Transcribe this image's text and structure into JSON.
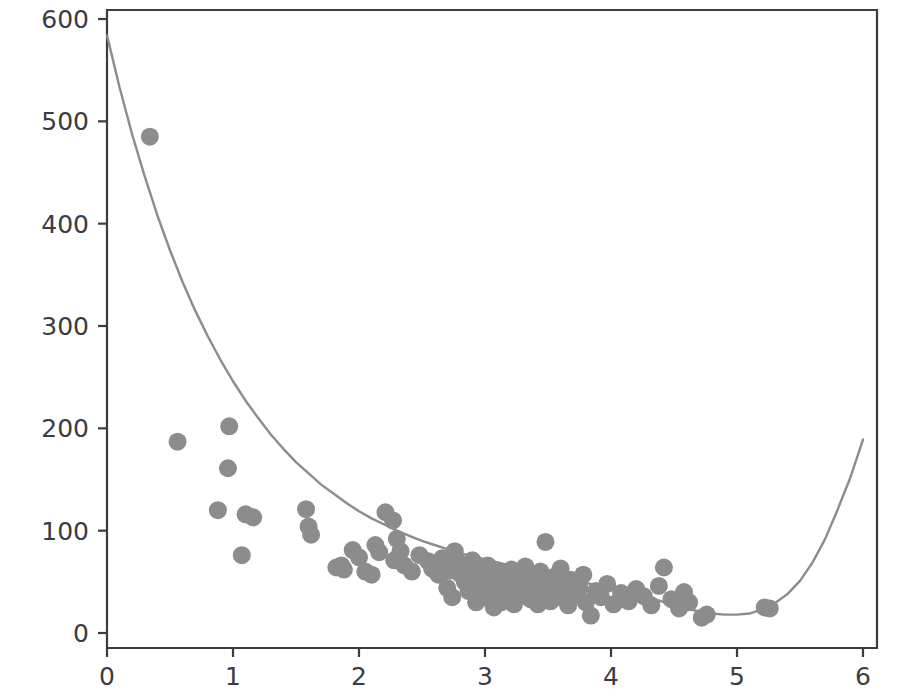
{
  "figure": {
    "background_color": "#ffffff",
    "axes_color": "#3b3b44",
    "point_color": "#8c8c8c",
    "curve_color": "#8c8c8c",
    "point_radius_px": 9,
    "plot_area_px": {
      "left": 107,
      "right": 877,
      "top": 10,
      "bottom": 648
    }
  },
  "chart_data": {
    "type": "scatter",
    "title": "",
    "subtitle": "",
    "xlabel": "",
    "ylabel": "",
    "xlim": [
      -0.25,
      6.1
    ],
    "ylim": [
      -15,
      620
    ],
    "grid": false,
    "legend": null,
    "xticks": [
      0,
      1,
      2,
      3,
      4,
      5,
      6
    ],
    "xtick_labels": [
      "0",
      "1",
      "2",
      "3",
      "4",
      "5",
      "6"
    ],
    "yticks": [
      0,
      100,
      200,
      300,
      400,
      500,
      600
    ],
    "ytick_labels": [
      "0",
      "100",
      "200",
      "300",
      "400",
      "500",
      "600"
    ],
    "series": [
      {
        "name": "observations",
        "kind": "scatter",
        "marker": "circle",
        "color": "#8c8c8c",
        "points": [
          [
            0.34,
            485
          ],
          [
            0.56,
            187
          ],
          [
            0.88,
            120
          ],
          [
            0.97,
            202
          ],
          [
            0.96,
            161
          ],
          [
            1.07,
            76
          ],
          [
            1.1,
            116
          ],
          [
            1.16,
            113
          ],
          [
            1.58,
            121
          ],
          [
            1.6,
            104
          ],
          [
            1.62,
            96
          ],
          [
            1.82,
            64
          ],
          [
            1.86,
            66
          ],
          [
            1.88,
            62
          ],
          [
            1.95,
            81
          ],
          [
            2.0,
            74
          ],
          [
            2.05,
            60
          ],
          [
            2.1,
            57
          ],
          [
            2.13,
            86
          ],
          [
            2.16,
            79
          ],
          [
            2.21,
            118
          ],
          [
            2.27,
            110
          ],
          [
            2.28,
            71
          ],
          [
            2.3,
            92
          ],
          [
            2.33,
            80
          ],
          [
            2.36,
            66
          ],
          [
            2.42,
            60
          ],
          [
            2.48,
            76
          ],
          [
            2.55,
            70
          ],
          [
            2.58,
            63
          ],
          [
            2.61,
            68
          ],
          [
            2.63,
            57
          ],
          [
            2.66,
            73
          ],
          [
            2.68,
            65
          ],
          [
            2.7,
            44
          ],
          [
            2.72,
            61
          ],
          [
            2.74,
            35
          ],
          [
            2.76,
            80
          ],
          [
            2.78,
            70
          ],
          [
            2.8,
            58
          ],
          [
            2.82,
            66
          ],
          [
            2.84,
            50
          ],
          [
            2.85,
            62
          ],
          [
            2.87,
            41
          ],
          [
            2.88,
            55
          ],
          [
            2.9,
            71
          ],
          [
            2.92,
            47
          ],
          [
            2.93,
            30
          ],
          [
            2.95,
            59
          ],
          [
            2.96,
            64
          ],
          [
            2.98,
            38
          ],
          [
            3.0,
            52
          ],
          [
            3.01,
            45
          ],
          [
            3.02,
            66
          ],
          [
            3.04,
            33
          ],
          [
            3.06,
            57
          ],
          [
            3.07,
            25
          ],
          [
            3.09,
            49
          ],
          [
            3.1,
            40
          ],
          [
            3.12,
            60
          ],
          [
            3.13,
            30
          ],
          [
            3.15,
            54
          ],
          [
            3.17,
            44
          ],
          [
            3.19,
            36
          ],
          [
            3.21,
            62
          ],
          [
            3.23,
            28
          ],
          [
            3.25,
            48
          ],
          [
            3.27,
            57
          ],
          [
            3.3,
            38
          ],
          [
            3.32,
            65
          ],
          [
            3.34,
            45
          ],
          [
            3.36,
            33
          ],
          [
            3.38,
            52
          ],
          [
            3.4,
            42
          ],
          [
            3.42,
            28
          ],
          [
            3.44,
            60
          ],
          [
            3.46,
            36
          ],
          [
            3.48,
            89
          ],
          [
            3.5,
            48
          ],
          [
            3.52,
            31
          ],
          [
            3.55,
            55
          ],
          [
            3.57,
            40
          ],
          [
            3.6,
            63
          ],
          [
            3.62,
            34
          ],
          [
            3.64,
            46
          ],
          [
            3.66,
            27
          ],
          [
            3.68,
            52
          ],
          [
            3.72,
            38
          ],
          [
            3.75,
            44
          ],
          [
            3.78,
            57
          ],
          [
            3.8,
            30
          ],
          [
            3.84,
            17
          ],
          [
            3.88,
            41
          ],
          [
            3.92,
            35
          ],
          [
            3.97,
            48
          ],
          [
            4.02,
            28
          ],
          [
            4.08,
            39
          ],
          [
            4.14,
            31
          ],
          [
            4.2,
            43
          ],
          [
            4.26,
            36
          ],
          [
            4.32,
            27
          ],
          [
            4.38,
            46
          ],
          [
            4.42,
            64
          ],
          [
            4.48,
            33
          ],
          [
            4.54,
            24
          ],
          [
            4.58,
            40
          ],
          [
            4.62,
            30
          ],
          [
            4.72,
            15
          ],
          [
            4.76,
            18
          ],
          [
            5.22,
            25
          ],
          [
            5.26,
            24
          ]
        ]
      },
      {
        "name": "fitted curve",
        "kind": "line",
        "color": "#8c8c8c",
        "points": [
          [
            0.0,
            584
          ],
          [
            0.1,
            533
          ],
          [
            0.2,
            487
          ],
          [
            0.3,
            446
          ],
          [
            0.4,
            408
          ],
          [
            0.5,
            374
          ],
          [
            0.6,
            343
          ],
          [
            0.7,
            315
          ],
          [
            0.8,
            290
          ],
          [
            0.9,
            267
          ],
          [
            1.0,
            246
          ],
          [
            1.1,
            227
          ],
          [
            1.2,
            210
          ],
          [
            1.3,
            194
          ],
          [
            1.4,
            180
          ],
          [
            1.5,
            167
          ],
          [
            1.6,
            156
          ],
          [
            1.7,
            145
          ],
          [
            1.8,
            136
          ],
          [
            1.9,
            127
          ],
          [
            2.0,
            119
          ],
          [
            2.1,
            112
          ],
          [
            2.2,
            106
          ],
          [
            2.3,
            100
          ],
          [
            2.4,
            95
          ],
          [
            2.5,
            90
          ],
          [
            2.6,
            86
          ],
          [
            2.7,
            82
          ],
          [
            2.8,
            78
          ],
          [
            2.9,
            75
          ],
          [
            3.0,
            72
          ],
          [
            3.1,
            69
          ],
          [
            3.2,
            66
          ],
          [
            3.3,
            63
          ],
          [
            3.4,
            60
          ],
          [
            3.5,
            58
          ],
          [
            3.6,
            55
          ],
          [
            3.7,
            52
          ],
          [
            3.8,
            49
          ],
          [
            3.9,
            46
          ],
          [
            4.0,
            43
          ],
          [
            4.1,
            40
          ],
          [
            4.2,
            37
          ],
          [
            4.3,
            34
          ],
          [
            4.4,
            31
          ],
          [
            4.5,
            27
          ],
          [
            4.6,
            24
          ],
          [
            4.7,
            21
          ],
          [
            4.8,
            19
          ],
          [
            4.9,
            18
          ],
          [
            5.0,
            18
          ],
          [
            5.1,
            19
          ],
          [
            5.2,
            23
          ],
          [
            5.3,
            29
          ],
          [
            5.4,
            38
          ],
          [
            5.5,
            51
          ],
          [
            5.6,
            69
          ],
          [
            5.7,
            92
          ],
          [
            5.8,
            121
          ],
          [
            5.9,
            152
          ],
          [
            6.0,
            189
          ]
        ]
      }
    ]
  }
}
